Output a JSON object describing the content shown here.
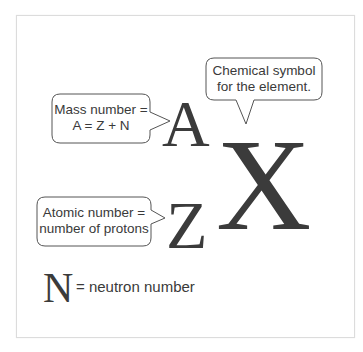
{
  "diagram": {
    "symbols": {
      "mass": "A",
      "atomic": "Z",
      "element": "X",
      "neutron": "N"
    },
    "callouts": [
      {
        "id": "element",
        "line1": "Chemical symbol",
        "line2": "for the element."
      },
      {
        "id": "mass",
        "line1": "Mass number =",
        "line2": "A = Z + N"
      },
      {
        "id": "atomic",
        "line1": "Atomic number =",
        "line2": "number of protons"
      }
    ],
    "legend": {
      "symbol": "N",
      "text": "= neutron number"
    },
    "colors": {
      "text": "#3a3a3a",
      "border": "#dcdcdc",
      "bubble_stroke": "#555555",
      "background": "#ffffff"
    }
  }
}
